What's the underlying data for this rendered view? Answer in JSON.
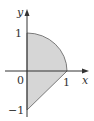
{
  "diagram": {
    "axes": {
      "x_label": "x",
      "y_label": "y",
      "origin_label": "0"
    },
    "ticks": {
      "x_one": "1",
      "y_one": "1",
      "y_minus_one": "−1"
    },
    "region": {
      "description": "Shaded region bounded by the y-axis, the quarter circle x^2+y^2=1 from (0,1) to (1,0), and the line y = x - 1 from (1,0) to (0,-1)",
      "vertices": [
        [
          0,
          1
        ],
        [
          1,
          0
        ],
        [
          0,
          -1
        ]
      ],
      "arc": {
        "center": [
          0,
          0
        ],
        "radius": 1,
        "from_deg": 90,
        "to_deg": 0
      },
      "fill_color": "#d6d6d6",
      "stroke_color": "#666666"
    },
    "axis_color": "#333333"
  }
}
